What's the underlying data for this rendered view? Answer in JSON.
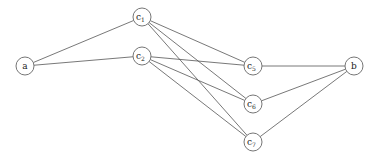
{
  "graph": {
    "nodes": [
      {
        "id": "a",
        "label": "a",
        "sub": "",
        "x": 25,
        "y": 66
      },
      {
        "id": "c1",
        "label": "c",
        "sub": "1",
        "x": 142,
        "y": 17
      },
      {
        "id": "c2",
        "label": "c",
        "sub": "2",
        "x": 142,
        "y": 56
      },
      {
        "id": "c5",
        "label": "c",
        "sub": "5",
        "x": 253,
        "y": 66
      },
      {
        "id": "c6",
        "label": "c",
        "sub": "6",
        "x": 253,
        "y": 104
      },
      {
        "id": "c7",
        "label": "c",
        "sub": "7",
        "x": 253,
        "y": 142
      },
      {
        "id": "b",
        "label": "b",
        "sub": "",
        "x": 354,
        "y": 66
      }
    ],
    "edges": [
      [
        "a",
        "c1"
      ],
      [
        "a",
        "c2"
      ],
      [
        "c1",
        "c5"
      ],
      [
        "c1",
        "c6"
      ],
      [
        "c1",
        "c7"
      ],
      [
        "c2",
        "c5"
      ],
      [
        "c2",
        "c6"
      ],
      [
        "c2",
        "c7"
      ],
      [
        "c5",
        "b"
      ],
      [
        "c6",
        "b"
      ],
      [
        "c7",
        "b"
      ]
    ],
    "node_radius": 9,
    "colors": {
      "edge": "#555555",
      "node_stroke": "#666666",
      "text": "#222222"
    }
  }
}
